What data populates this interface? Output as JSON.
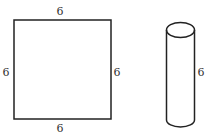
{
  "square": {
    "top_label": "6",
    "bottom_label": "6",
    "left_label": "6",
    "right_label": "6"
  },
  "cylinder": {
    "height_label": "6"
  },
  "colors": {
    "stroke": "#222222",
    "text": "#333333",
    "background": "#ffffff"
  }
}
